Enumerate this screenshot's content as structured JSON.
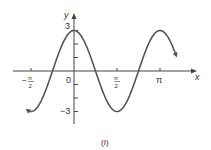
{
  "chart_data": {
    "type": "line",
    "title": "",
    "caption": "(I)",
    "xlabel": "x",
    "ylabel": "y",
    "function": "y = 3cos(2x)",
    "x_ticks": [
      "-π/2",
      "0",
      "π/2",
      "π"
    ],
    "y_ticks": [
      "3",
      "-3"
    ],
    "xlim": [
      -2.05,
      3.69
    ],
    "ylim": [
      -3.5,
      3.5
    ],
    "series": [
      {
        "name": "y = 3cos(2x)",
        "x": [
          -1.5708,
          -0.7854,
          0,
          0.7854,
          1.5708,
          2.3562,
          3.1416,
          3.927
        ],
        "y": [
          -3,
          0,
          3,
          0,
          -3,
          0,
          3,
          0
        ]
      }
    ],
    "color": "#555555"
  },
  "labels": {
    "y_axis": "y",
    "x_axis": "x",
    "y_top": "3",
    "y_bottom": "−3",
    "origin": "0",
    "neg_half_pi_num": "π",
    "neg_half_pi_den": "2",
    "neg_sign": "−",
    "half_pi_num": "π",
    "half_pi_den": "2",
    "pi": "π",
    "caption": "(I)"
  }
}
